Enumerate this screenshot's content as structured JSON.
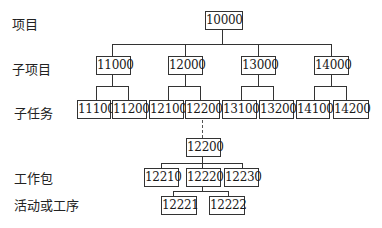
{
  "level_labels": {
    "project": "项目",
    "subproject": "子项目",
    "subtask": "子任务",
    "work_package": "工作包",
    "activity": "活动或工序"
  },
  "nodes": {
    "root": "10000",
    "sub": [
      "11000",
      "12000",
      "13000",
      "14000"
    ],
    "tasks": [
      "11100",
      "11200",
      "12100",
      "12200",
      "13100",
      "13200",
      "14100",
      "14200"
    ],
    "expanded": "12200",
    "packages": [
      "12210",
      "12220",
      "12230"
    ],
    "activities": [
      "12221",
      "12222"
    ]
  }
}
